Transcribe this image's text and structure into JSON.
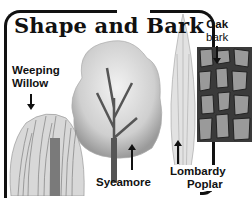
{
  "title": "Shape and Bark",
  "labels": {
    "weeping_willow": [
      "Weeping",
      "Willow"
    ],
    "sycamore": "Sycamore",
    "lombardy_poplar": [
      "Lombardy",
      "Poplar"
    ],
    "oak_bark": [
      "Oak",
      "bark"
    ]
  },
  "illustrations": [
    "weeping-willow-tree",
    "sycamore-tree",
    "lombardy-poplar-tree",
    "oak-bark-texture"
  ],
  "colors": {
    "ink": "#111111",
    "paper": "#ffffff"
  }
}
